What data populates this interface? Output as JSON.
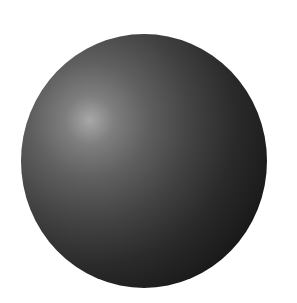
{
  "scene": {
    "subject": "dark gray sphere",
    "background_color": "#ffffff",
    "sphere_colors": {
      "highlight": "#a8a8a8",
      "midtone": "#4a4a4a",
      "shadow": "#121212"
    }
  }
}
